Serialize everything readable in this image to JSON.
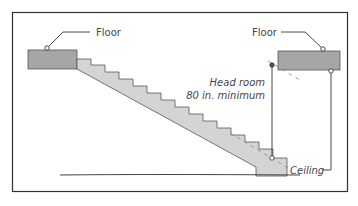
{
  "diagram": {
    "labels": {
      "floor_left": "Floor",
      "floor_right": "Floor",
      "head_room_line1": "Head room",
      "head_room_line2": "80 in. minimum",
      "ceiling": "Ceiling"
    },
    "colors": {
      "slab": "#a6a6a6",
      "stair": "#d4d4d4",
      "line": "#333333",
      "frame": "#333333"
    }
  }
}
